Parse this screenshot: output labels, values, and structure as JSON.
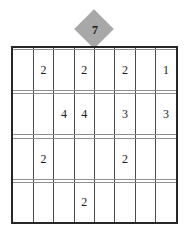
{
  "puzzle": {
    "badge": {
      "icon": "diamond-marker",
      "value": "7",
      "fill_color": "#a8a8a8",
      "text_color": "#171717"
    },
    "grid": {
      "rows": 8,
      "columns": 8,
      "border_color": "#262626",
      "vertical_line_color": "#4a4a4a",
      "horizontal_line_color": "#8e8e8e",
      "background_color": "#ffffff",
      "cells": [
        [
          "",
          "",
          "",
          "",
          "",
          "",
          "",
          ""
        ],
        [
          "",
          "2",
          "",
          "2",
          "",
          "2",
          "",
          "1"
        ],
        [
          "",
          "",
          "",
          "",
          "",
          "",
          "",
          ""
        ],
        [
          "",
          "",
          "4",
          "4",
          "",
          "3",
          "",
          "3"
        ],
        [
          "",
          "",
          "",
          "",
          "",
          "",
          "",
          ""
        ],
        [
          "",
          "2",
          "",
          "",
          "",
          "2",
          "",
          ""
        ],
        [
          "",
          "",
          "",
          "",
          "",
          "",
          "",
          ""
        ],
        [
          "",
          "",
          "",
          "2",
          "",
          "",
          "",
          ""
        ]
      ]
    }
  }
}
